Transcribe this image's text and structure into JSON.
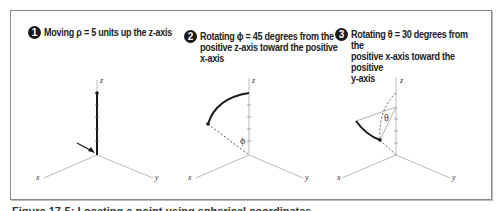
{
  "figure": {
    "caption": "Figure 17-5: Locating a point using spherical coordinates",
    "steps": [
      {
        "number": "1",
        "text": "Moving ρ = 5 units up the z-axis"
      },
      {
        "number": "2",
        "text": "Rotating  ϕ = 45 degrees from the\npositive z-axis toward the positive\nx-axis"
      },
      {
        "number": "3",
        "text": "Rotating  θ = 30 degrees from the\npositive x-axis toward the positive\ny-axis"
      }
    ],
    "diagrams": [
      {
        "axes": {
          "x": "x",
          "y": "y",
          "z": "z"
        },
        "annotation": "arrow-to-origin"
      },
      {
        "axes": {
          "x": "x",
          "y": "y",
          "z": "z"
        },
        "angle_label": "ϕ"
      },
      {
        "axes": {
          "x": "x",
          "y": "y",
          "z": "z"
        },
        "angle_label": "θ"
      }
    ]
  },
  "colors": {
    "frame": "#8a8a8a",
    "axis": "#9a9a9a",
    "path": "#1a1a1a"
  }
}
